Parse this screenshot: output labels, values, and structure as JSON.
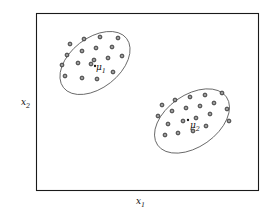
{
  "figure": {
    "title": "",
    "background_color": "#ffffff",
    "frame_color": "#1a1a1a",
    "point_color": "#333333",
    "ellipse_color": "#555555",
    "width": 274,
    "height": 219
  },
  "axes": {
    "xlabel": "x",
    "xlabel_sub": "1",
    "ylabel": "x",
    "ylabel_sub": "2",
    "frame": {
      "left": 36,
      "top": 13,
      "right": 258,
      "bottom": 190
    }
  },
  "annotations": {
    "mu1": {
      "label": "μ",
      "sub": "1"
    },
    "mu2": {
      "label": "μ",
      "sub": "2"
    }
  },
  "chart_data": {
    "type": "scatter",
    "title": "",
    "xlabel": "x1",
    "ylabel": "x2",
    "grid": false,
    "legend": false,
    "xlim": [
      36,
      258
    ],
    "ylim": [
      13,
      190
    ],
    "clusters": [
      {
        "name": "cluster-1",
        "mean_label": "μ1",
        "mean": [
          95,
          66
        ],
        "ellipse": {
          "cx": 95,
          "cy": 63,
          "rx": 40,
          "ry": 25,
          "rotation": -38
        },
        "points": [
          [
            70,
            44
          ],
          [
            84,
            39
          ],
          [
            100,
            37
          ],
          [
            118,
            38
          ],
          [
            67,
            55
          ],
          [
            82,
            51
          ],
          [
            96,
            48
          ],
          [
            112,
            47
          ],
          [
            62,
            65
          ],
          [
            78,
            63
          ],
          [
            94,
            60
          ],
          [
            108,
            58
          ],
          [
            122,
            56
          ],
          [
            65,
            76
          ],
          [
            82,
            78
          ],
          [
            97,
            79
          ],
          [
            113,
            72
          ],
          [
            91,
            64
          ]
        ]
      },
      {
        "name": "cluster-2",
        "mean_label": "μ2",
        "mean": [
          188,
          120
        ],
        "ellipse": {
          "cx": 192,
          "cy": 121,
          "rx": 42,
          "ry": 26,
          "rotation": -35
        },
        "points": [
          [
            162,
            105
          ],
          [
            175,
            100
          ],
          [
            190,
            97
          ],
          [
            205,
            95
          ],
          [
            222,
            93
          ],
          [
            158,
            116
          ],
          [
            172,
            111
          ],
          [
            186,
            108
          ],
          [
            200,
            106
          ],
          [
            214,
            103
          ],
          [
            168,
            124
          ],
          [
            183,
            121
          ],
          [
            196,
            118
          ],
          [
            210,
            114
          ],
          [
            227,
            109
          ],
          [
            165,
            135
          ],
          [
            178,
            133
          ],
          [
            193,
            131
          ],
          [
            206,
            126
          ],
          [
            229,
            121
          ],
          [
            188,
            120
          ]
        ]
      }
    ]
  }
}
